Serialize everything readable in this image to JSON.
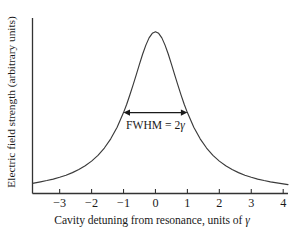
{
  "chart_data": {
    "type": "line",
    "title": "",
    "xlabel": "Cavity detuning from resonance, units of γ",
    "ylabel": "Electric field strength (arbitrary units)",
    "xlabel_prefix": "Cavity detuning from resonance, units of ",
    "xlabel_symbol": "γ",
    "xlim": [
      -3.85,
      4.15
    ],
    "ylim": [
      0,
      1.06
    ],
    "grid": false,
    "legend": null,
    "xticks": [
      -3,
      -2,
      -1,
      0,
      1,
      2,
      3,
      4
    ],
    "xtick_labels": [
      "−3",
      "−2",
      "−1",
      "0",
      "1",
      "2",
      "3",
      "4"
    ],
    "yticks": [],
    "ytick_labels": [],
    "series": [
      {
        "name": "Lorentzian cavity response",
        "function": "1 / (1 + x^2)",
        "color": "#3a3a3a",
        "x": [
          -3.85,
          -3.6,
          -3.4,
          -3.2,
          -3.0,
          -2.8,
          -2.6,
          -2.4,
          -2.2,
          -2.0,
          -1.8,
          -1.6,
          -1.4,
          -1.2,
          -1.0,
          -0.9,
          -0.8,
          -0.7,
          -0.6,
          -0.5,
          -0.4,
          -0.3,
          -0.2,
          -0.1,
          0.0,
          0.1,
          0.2,
          0.3,
          0.4,
          0.5,
          0.6,
          0.7,
          0.8,
          0.9,
          1.0,
          1.2,
          1.4,
          1.6,
          1.8,
          2.0,
          2.2,
          2.4,
          2.6,
          2.8,
          3.0,
          3.2,
          3.4,
          3.6,
          4.15
        ],
        "y": [
          0.063,
          0.072,
          0.08,
          0.089,
          0.1,
          0.113,
          0.129,
          0.148,
          0.171,
          0.2,
          0.236,
          0.281,
          0.338,
          0.41,
          0.5,
          0.552,
          0.61,
          0.671,
          0.735,
          0.8,
          0.862,
          0.917,
          0.962,
          0.99,
          1.0,
          0.99,
          0.962,
          0.917,
          0.862,
          0.8,
          0.735,
          0.671,
          0.61,
          0.552,
          0.5,
          0.41,
          0.338,
          0.281,
          0.236,
          0.2,
          0.171,
          0.148,
          0.129,
          0.113,
          0.1,
          0.089,
          0.08,
          0.072,
          0.055
        ]
      }
    ],
    "annotations": [
      {
        "name": "fwhm-arrow",
        "type": "double-arrow",
        "text": "FWHM = 2γ",
        "text_prefix": "FWHM = 2",
        "text_symbol": "γ",
        "x_start": -1.0,
        "x_end": 1.0,
        "y": 0.5
      }
    ],
    "axis_color": "#333333",
    "curve_color": "#3a3a3a",
    "background": "#ffffff"
  }
}
